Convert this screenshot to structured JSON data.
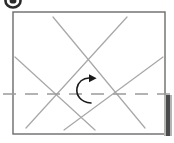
{
  "document": {
    "title": "Folding diagram",
    "caption": ""
  },
  "canvas": {
    "width": 174,
    "height": 143,
    "background": "#ffffff"
  },
  "colors": {
    "panel_border": "#6b6b6b",
    "crease_line": "#a8a8a8",
    "axis_dash": "#9a9a9a",
    "arrow": "#1a1a1a",
    "bullet": "#2a2a2a",
    "edge_bar": "#4a4a4a",
    "edge_bar_light": "#b5b5b5"
  },
  "panel": {
    "name": "sheet-outline",
    "x": 13,
    "y": 12,
    "width": 152,
    "height": 122,
    "stroke_width": 1.4,
    "fill": "#ffffff"
  },
  "bullet_marker": {
    "name": "list-bullet",
    "cx": 13,
    "cy": 1,
    "rx": 7.5,
    "ry": 6.5,
    "inner_rx": 3.4,
    "inner_ry": 2.6
  },
  "edge_bar": {
    "name": "right-edge-bar",
    "x": 166,
    "y": 95,
    "width": 4,
    "height": 41
  },
  "axis_line": {
    "name": "center-axis",
    "x1": 3,
    "y1": 94,
    "x2": 172,
    "y2": 94,
    "dash": "13 9",
    "stroke_width": 1.3
  },
  "crease_lines": [
    {
      "name": "crease-1",
      "x1": 53,
      "y1": 17,
      "x2": 145,
      "y2": 128
    },
    {
      "name": "crease-2",
      "x1": 127,
      "y1": 17,
      "x2": 26,
      "y2": 128
    },
    {
      "name": "crease-3",
      "x1": 15,
      "y1": 57,
      "x2": 95,
      "y2": 130
    },
    {
      "name": "crease-4",
      "x1": 163,
      "y1": 57,
      "x2": 64,
      "y2": 130
    }
  ],
  "intersections": [
    {
      "name": "crease-node-left",
      "cx": 52,
      "cy": 94
    },
    {
      "name": "crease-node-right",
      "cx": 125,
      "cy": 94
    },
    {
      "name": "crease-node-top",
      "cx": 90,
      "cy": 56
    }
  ],
  "rotation_arrow": {
    "name": "rotation-arrow",
    "path": "M 91 103 C 80 102 76 95 77 88 C 78 82 83 78 89 78",
    "stroke_width": 1.6,
    "head": "M 89 74.2 L 96.6 78.2 L 89 82.2 Z"
  }
}
